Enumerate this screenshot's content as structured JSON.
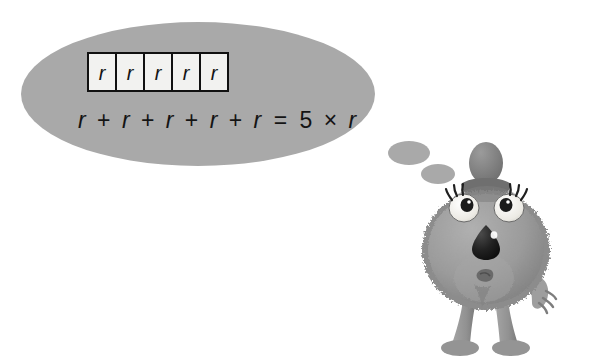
{
  "scene": {
    "title": "Multiplication as repeated addition thought bubble",
    "background_color": "#ffffff"
  },
  "thought_bubble": {
    "name": "thought-bubble",
    "fill_color": "#a9a9a9",
    "shape": "ellipse",
    "center_x": 198,
    "center_y": 94,
    "radius_x": 177,
    "radius_y": 72,
    "trail": [
      {
        "center_x": 409,
        "center_y": 153,
        "radius_x": 21,
        "radius_y": 12,
        "fill_color": "#a9a9a9"
      },
      {
        "center_x": 438,
        "center_y": 174,
        "radius_x": 17,
        "radius_y": 10,
        "fill_color": "#a9a9a9"
      }
    ]
  },
  "boxes_row": {
    "name": "r-boxes-row",
    "count": 5,
    "labels": [
      "r",
      "r",
      "r",
      "r",
      "r"
    ],
    "box_fill_color": "#f2f2f0",
    "box_border_color": "#111111",
    "left": 88,
    "top": 53,
    "box_width": 28,
    "box_height": 38,
    "border_width": 2
  },
  "equation": {
    "name": "equation",
    "full_text": "r + r + r + r + r = 5 × r",
    "text_color": "#141414",
    "tokens": [
      {
        "text": "r",
        "kind": "variable"
      },
      {
        "text": "+",
        "kind": "operator"
      },
      {
        "text": "r",
        "kind": "variable"
      },
      {
        "text": "+",
        "kind": "operator"
      },
      {
        "text": "r",
        "kind": "variable"
      },
      {
        "text": "+",
        "kind": "operator"
      },
      {
        "text": "r",
        "kind": "variable"
      },
      {
        "text": "+",
        "kind": "operator"
      },
      {
        "text": "r",
        "kind": "variable"
      },
      {
        "text": "=",
        "kind": "operator"
      },
      {
        "text": "5",
        "kind": "number"
      },
      {
        "text": "×",
        "kind": "operator"
      },
      {
        "text": "r",
        "kind": "variable"
      }
    ],
    "left_terms": "r + r + r + r + r",
    "right_term": "5 × r",
    "multiplier": "5",
    "variable": "r"
  },
  "character": {
    "name": "fuzzy-monster-character",
    "description": "Round furry monster with small hat, two large lashed eyes, dark nose and two legs",
    "body_color": "#9a9a9a",
    "body_shade_color": "#868686",
    "body_light_color": "#ababab",
    "hat_color": "#8a8a8a",
    "hat_dark_color": "#6f6f6f",
    "eye_white_color": "#efeeea",
    "pupil_color": "#1b1b1b",
    "nose_color": "#1e1e1e",
    "limb_color": "#939393",
    "outline_color": "#5f5f5f",
    "parts": [
      {
        "name": "hat",
        "label": "hat"
      },
      {
        "name": "left-eye",
        "label": "left eye"
      },
      {
        "name": "right-eye",
        "label": "right eye"
      },
      {
        "name": "nose",
        "label": "nose"
      },
      {
        "name": "mouth",
        "label": "mouth"
      },
      {
        "name": "left-leg",
        "label": "left leg"
      },
      {
        "name": "right-leg",
        "label": "right leg"
      },
      {
        "name": "right-hand",
        "label": "right hand"
      }
    ]
  }
}
